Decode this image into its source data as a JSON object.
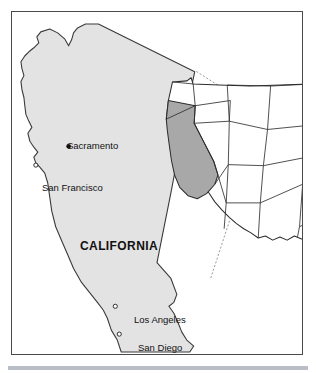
{
  "figure": {
    "name": "california-locator-map",
    "frame_border_color": "#4a4a4a",
    "background_color": "#ffffff",
    "bottom_rule_color": "#b9bec7"
  },
  "main_map": {
    "state_label": "CALIFORNIA",
    "state_fill_color": "#e3e3e3",
    "state_outline_color": "#3a3a3a",
    "cities": [
      {
        "name": "Sacramento",
        "marker": "filled-dot",
        "marker_x": 68,
        "marker_y": 146,
        "label_x": 55,
        "label_y": 129
      },
      {
        "name": "San Francisco",
        "marker": "open-circle",
        "marker_x": 35,
        "marker_y": 165,
        "label_x": 30,
        "label_y": 171
      },
      {
        "name": "Los Angeles",
        "marker": "open-circle",
        "marker_x": 115,
        "marker_y": 307,
        "label_x": 122,
        "label_y": 303
      },
      {
        "name": "San Diego",
        "marker": "open-circle",
        "marker_x": 119,
        "marker_y": 335,
        "label_x": 126,
        "label_y": 331
      }
    ]
  },
  "inset_map": {
    "title": "united-states-inset",
    "highlighted_state": "California",
    "highlight_fill_color": "#a8a8a8",
    "state_fill_color": "#ffffff",
    "state_outline_color": "#2c2c2c"
  },
  "connectors": {
    "style": "dotted",
    "color": "#9a9a9a",
    "count": 2
  }
}
